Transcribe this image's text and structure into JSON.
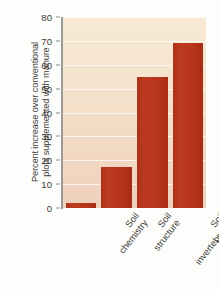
{
  "chart_data": {
    "type": "bar",
    "title": "",
    "xlabel": "",
    "ylabel": "Percent increase over conventional plots supplemented with manure",
    "ylabel_lines": [
      "Percent increase over conventional",
      "plots supplemented with manure"
    ],
    "categories": [
      "Soil chemistry",
      "Soil structure",
      "Soil invertebrates",
      "Microbial activity"
    ],
    "category_lines": [
      [
        "Soil",
        "chemistry"
      ],
      [
        "Soil",
        "structure"
      ],
      [
        "Soil",
        "invertebrates"
      ],
      [
        "Microbial",
        "activity"
      ]
    ],
    "values": [
      2,
      17,
      55,
      69
    ],
    "ylim": [
      0,
      80
    ],
    "yticks": [
      0,
      10,
      20,
      30,
      40,
      50,
      60,
      70,
      80
    ],
    "ytick_labels": [
      "0",
      "10",
      "20",
      "30",
      "40",
      "50",
      "60",
      "70",
      "80"
    ],
    "grid": true,
    "legend": "none",
    "bar_color": "#b8361b",
    "plot_background_top": "#f7e9d6",
    "plot_background_bottom": "#efd0bb",
    "axis_color": "#9a9a9a",
    "gridline_color": "#ffffff",
    "text_color": "#3d3d3d"
  }
}
